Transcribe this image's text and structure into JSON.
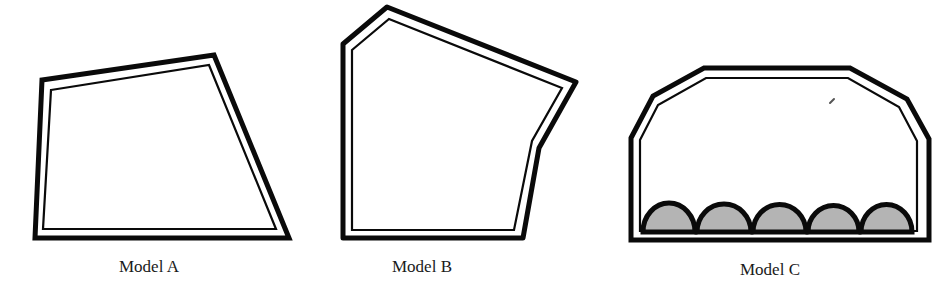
{
  "figure": {
    "models": [
      {
        "id": "A",
        "label": "Model A"
      },
      {
        "id": "B",
        "label": "Model B"
      },
      {
        "id": "C",
        "label": "Model C"
      }
    ],
    "colors": {
      "outline": "#0a0a0a",
      "background": "#ffffff",
      "bump_fill": "#b4b4b4"
    },
    "model_c_bump_count": 5
  }
}
